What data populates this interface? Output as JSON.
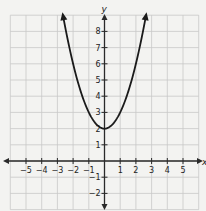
{
  "chart_data": {
    "type": "line",
    "title": "",
    "xlabel": "x",
    "ylabel": "y",
    "xlim": [
      -6,
      6
    ],
    "ylim": [
      -3,
      9
    ],
    "grid": true,
    "x_ticks": [
      -5,
      -4,
      -3,
      -2,
      -1,
      1,
      2,
      3,
      4,
      5
    ],
    "y_ticks": [
      -2,
      -1,
      1,
      2,
      3,
      4,
      5,
      6,
      7,
      8
    ],
    "x_tick_labels": [
      "−5",
      "−4",
      "−3",
      "−2",
      "−1",
      "1",
      "2",
      "3",
      "4",
      "5"
    ],
    "y_tick_labels": [
      "−2",
      "−1",
      "1",
      "2",
      "3",
      "4",
      "5",
      "6",
      "7",
      "8"
    ],
    "series": [
      {
        "name": "parabola",
        "equation": "y = x^2 + 2",
        "vertex": [
          0,
          2
        ],
        "x": [
          -2.65,
          -2,
          -1.5,
          -1,
          -0.5,
          0,
          0.5,
          1,
          1.5,
          2,
          2.65
        ],
        "y": [
          9.0,
          6,
          4.25,
          3,
          2.25,
          2,
          2.25,
          3,
          4.25,
          6,
          9.0
        ],
        "arrows_at_ends": true,
        "color": "#1a1a1a"
      }
    ]
  },
  "colors": {
    "background": "#f3f3f1",
    "grid": "#c8c8c8",
    "axis": "#2a2a2a",
    "curve": "#1a1a1a"
  }
}
